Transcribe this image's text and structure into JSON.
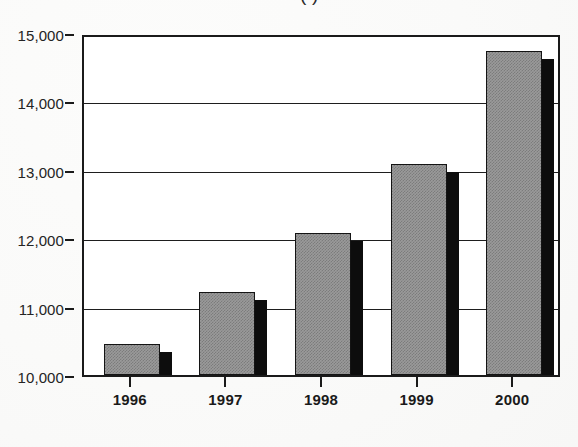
{
  "chart_data": {
    "type": "bar",
    "title": "(                              )",
    "subtitle": "",
    "xlabel": "",
    "ylabel": "",
    "categories": [
      "1996",
      "1997",
      "1998",
      "1999",
      "2000"
    ],
    "values": [
      10450,
      11220,
      12070,
      13090,
      14740
    ],
    "series": [
      {
        "name": "",
        "values": [
          10450,
          11220,
          12070,
          13090,
          14740
        ]
      }
    ],
    "ylim": [
      10000,
      15000
    ],
    "ytick_values": [
      15000,
      14000,
      13000,
      12000,
      11000,
      10000
    ],
    "ytick_labels": [
      "15,000",
      "14,000",
      "13,000",
      "12,000",
      "11,000",
      "10,000"
    ],
    "grid": true,
    "grid_axis": "y",
    "legend": false,
    "legend_position": "none",
    "bar_style": "3d-shadow",
    "bar_face_color": "#9a9a9a",
    "bar_side_color": "#0d0d0d",
    "bar_outline_color": "#141414",
    "axis_color": "#1a1a1a",
    "background_color": "#ffffff",
    "annotations": []
  },
  "figure": {
    "title_cropped": true,
    "title_note": "(                              )"
  }
}
